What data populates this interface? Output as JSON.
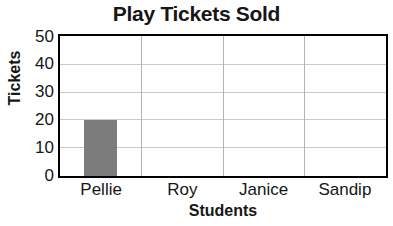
{
  "chart_data": {
    "type": "bar",
    "title": "Play Tickets Sold",
    "xlabel": "Students",
    "ylabel": "Tickets",
    "categories": [
      "Pellie",
      "Roy",
      "Janice",
      "Sandip"
    ],
    "values": [
      20,
      0,
      0,
      0
    ],
    "ylim": [
      0,
      50
    ],
    "yticks": [
      0,
      10,
      20,
      30,
      40,
      50
    ],
    "ytick_labels": [
      "0",
      "10",
      "20",
      "30",
      "40",
      "50"
    ],
    "grid": "horizontal-and-vertical",
    "legend": "none",
    "bar_color": "#7c7c7c",
    "axis_color": "#000000",
    "gridline_color": "#c9c9c9",
    "background": "#ffffff"
  }
}
